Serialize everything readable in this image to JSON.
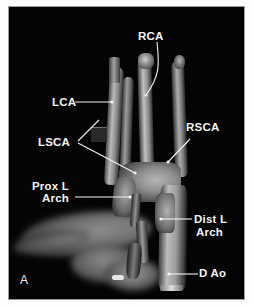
{
  "figure": {
    "panel_id": "A",
    "modality": "3D volume-rendered angiogram (grayscale)",
    "background_color": "#050505",
    "label_color": "#f4f4f4",
    "frame_color": "#9a9a9a"
  },
  "annotations": [
    {
      "key": "rca",
      "label": "RCA",
      "x": 138,
      "y": 30,
      "leader": "curve-down-left"
    },
    {
      "key": "lca",
      "label": "LCA",
      "x": 52,
      "y": 97,
      "leader": "horizontal-right"
    },
    {
      "key": "lsca",
      "label": "LSCA",
      "x": 38,
      "y": 138,
      "leader": "two-branch-right"
    },
    {
      "key": "rsca",
      "label": "RSCA",
      "x": 186,
      "y": 122,
      "leader": "diagonal-down-left"
    },
    {
      "key": "prox_l_arch_line1",
      "label": "Prox L",
      "x": 32,
      "y": 181,
      "leader": "none"
    },
    {
      "key": "prox_l_arch_line2",
      "label": "Arch",
      "x": 42,
      "y": 193,
      "leader": "horizontal-right"
    },
    {
      "key": "dist_l_arch_line1",
      "label": "Dist L",
      "x": 194,
      "y": 215,
      "leader": "horizontal-left"
    },
    {
      "key": "dist_l_arch_line2",
      "label": "Arch",
      "x": 196,
      "y": 228,
      "leader": "none"
    },
    {
      "key": "d_ao",
      "label": "D Ao",
      "x": 199,
      "y": 268,
      "leader": "horizontal-left"
    }
  ],
  "legend_meanings": {
    "RCA": "Right carotid artery",
    "LCA": "Left carotid artery",
    "LSCA": "Left subclavian artery",
    "RSCA": "Right subclavian artery",
    "Prox L Arch": "Proximal left arch",
    "Dist L Arch": "Distal left arch",
    "D Ao": "Descending aorta"
  }
}
